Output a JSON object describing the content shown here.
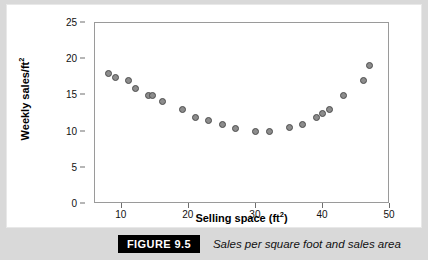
{
  "figure": {
    "badge": "FIGURE 9.5",
    "caption": "Sales per square foot and sales area"
  },
  "chart_data": {
    "type": "scatter",
    "title": "",
    "xlabel": "Selling space (ft2)",
    "xlabel_base": "Selling space (ft",
    "xlabel_sup": "2",
    "xlabel_tail": ")",
    "ylabel": "Weekly sales/ft2",
    "ylabel_base": "Weekly sales/ft",
    "ylabel_sup": "2",
    "xlim": [
      6,
      50
    ],
    "ylim": [
      0,
      25
    ],
    "xticks": [
      10,
      20,
      30,
      40,
      50
    ],
    "yticks": [
      0,
      5,
      10,
      15,
      20,
      25
    ],
    "grid": false,
    "legend": false,
    "marker": {
      "shape": "circle",
      "fill": "#8c8c8c",
      "edge": "#4d4d4d",
      "size_px": 7
    },
    "points": [
      {
        "x": 8.0,
        "y": 18.0
      },
      {
        "x": 9.0,
        "y": 17.5
      },
      {
        "x": 11.0,
        "y": 17.0
      },
      {
        "x": 12.0,
        "y": 16.0
      },
      {
        "x": 14.0,
        "y": 15.0
      },
      {
        "x": 14.6,
        "y": 15.0
      },
      {
        "x": 16.0,
        "y": 14.2
      },
      {
        "x": 19.0,
        "y": 13.0
      },
      {
        "x": 21.0,
        "y": 12.0
      },
      {
        "x": 23.0,
        "y": 11.5
      },
      {
        "x": 25.0,
        "y": 11.0
      },
      {
        "x": 27.0,
        "y": 10.4
      },
      {
        "x": 30.0,
        "y": 10.0
      },
      {
        "x": 32.0,
        "y": 10.0
      },
      {
        "x": 35.0,
        "y": 10.5
      },
      {
        "x": 37.0,
        "y": 11.0
      },
      {
        "x": 39.0,
        "y": 12.0
      },
      {
        "x": 40.0,
        "y": 12.5
      },
      {
        "x": 41.0,
        "y": 13.0
      },
      {
        "x": 43.0,
        "y": 15.0
      },
      {
        "x": 46.0,
        "y": 17.0
      },
      {
        "x": 47.0,
        "y": 19.1
      }
    ]
  }
}
